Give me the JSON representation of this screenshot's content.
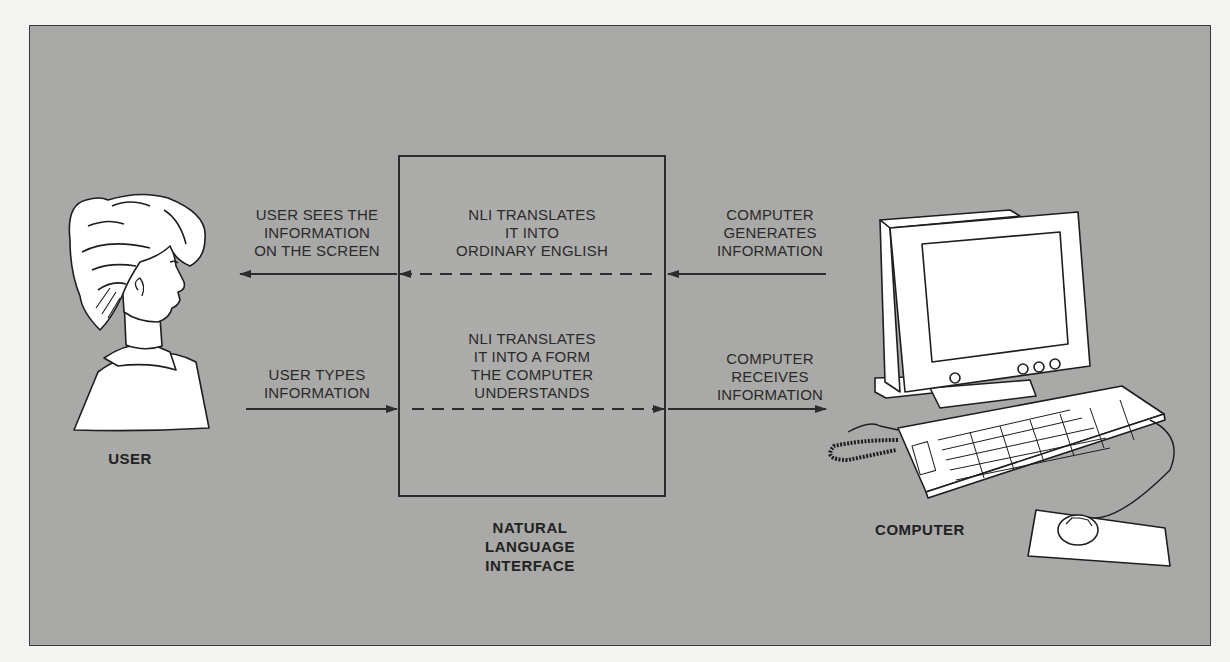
{
  "diagram": {
    "title": "Natural Language Interface",
    "nodes": {
      "user": {
        "label": "USER",
        "icon": "person-profile-icon"
      },
      "nli": {
        "label": "NATURAL\nLANGUAGE\nINTERFACE"
      },
      "computer": {
        "label": "COMPUTER",
        "icon": "desktop-computer-icon"
      }
    },
    "flows": {
      "top": {
        "left_label": "USER SEES THE\nINFORMATION\nON THE SCREEN",
        "middle_label": "NLI TRANSLATES\nIT INTO\nORDINARY ENGLISH",
        "right_label": "COMPUTER\nGENERATES\nINFORMATION",
        "direction": "computer-to-user"
      },
      "bottom": {
        "left_label": "USER TYPES\nINFORMATION",
        "middle_label": "NLI TRANSLATES\nIT INTO A FORM\nTHE COMPUTER\nUNDERSTANDS",
        "right_label": "COMPUTER\nRECEIVES\nINFORMATION",
        "direction": "user-to-computer"
      }
    }
  },
  "colors": {
    "panel_bg": "#a9a9a7",
    "page_bg": "#f4f4f2",
    "line": "#2c2c2c",
    "figure_fill": "#ffffff"
  }
}
